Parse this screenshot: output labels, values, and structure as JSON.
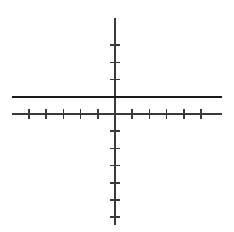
{
  "header": {
    "clipped_caption": "not shown by the"
  },
  "figure": {
    "name": "coordinate-plane-with-horizontal-line",
    "background_color": "#ffffff",
    "axis_color": "#3a3a3a",
    "line_color": "#1a1a1a",
    "axis_stroke_width": 1.6,
    "line_stroke_width": 2.6,
    "tick_stroke_width": 1.5
  },
  "chart_data": {
    "type": "line",
    "title": "",
    "subtitle": "",
    "xlabel": "",
    "ylabel": "",
    "xlim": [
      -6,
      6.3
    ],
    "ylim": [
      -5.85,
      5.05
    ],
    "grid": false,
    "legend": null,
    "legend_position": "none",
    "origin_px": {
      "x": 115,
      "y": 114
    },
    "unit_px": {
      "x": 17.2,
      "y": 17.2
    },
    "axes": {
      "x_axis": {
        "name": "x-axis",
        "from_px": {
          "x": 12,
          "y": 114
        },
        "to_px": {
          "x": 222,
          "y": 114
        },
        "ticks_left": 5,
        "ticks_right": 5,
        "tick_values": [
          -5,
          -4,
          -3,
          -2,
          -1,
          1,
          2,
          3,
          4,
          5
        ],
        "tick_half_length_px": 5,
        "tick_labels_shown": false
      },
      "y_axis": {
        "name": "y-axis",
        "from_px": {
          "x": 115,
          "y": 18
        },
        "to_px": {
          "x": 115,
          "y": 225
        },
        "ticks_above": 4,
        "ticks_below": 6,
        "tick_values": [
          4,
          3,
          2,
          1,
          -1,
          -2,
          -3,
          -4,
          -5,
          -6
        ],
        "tick_half_length_px": 5,
        "tick_labels_shown": false
      }
    },
    "series": [
      {
        "name": "constant-function",
        "kind": "horizontal-line",
        "equation": "y = 1",
        "y_value": 1,
        "x_from": -6,
        "x_to": 6.2,
        "px_y": 97,
        "px_x_from": 12,
        "px_x_to": 222,
        "color": "#1a1a1a",
        "stroke_width": 2.6,
        "x": [
          -6,
          6.2
        ],
        "values": [
          1,
          1
        ]
      }
    ],
    "annotations": []
  }
}
